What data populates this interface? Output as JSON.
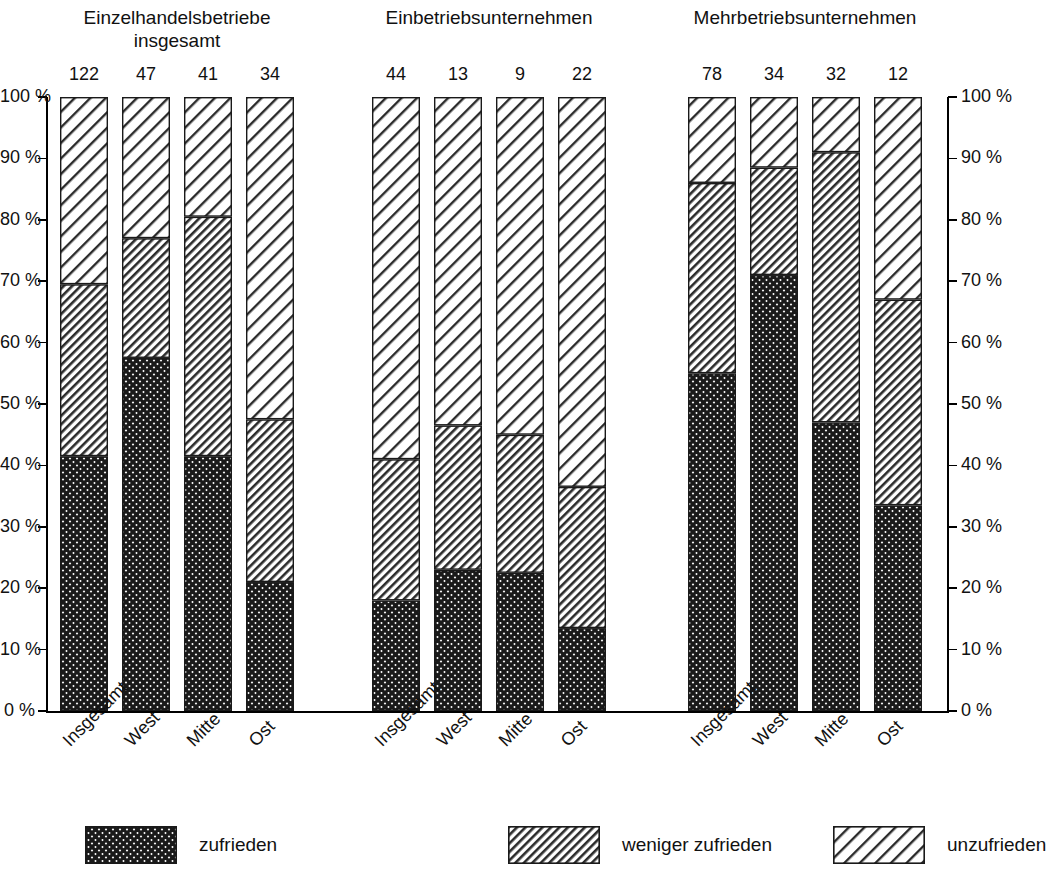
{
  "chart_data": {
    "type": "bar",
    "subtype": "stacked-percentage",
    "title": "",
    "xlabel": "",
    "ylabel": "",
    "ylim": [
      0,
      100
    ],
    "ytick_labels": [
      "0 %",
      "10 %",
      "20 %",
      "30 %",
      "40 %",
      "50 %",
      "60 %",
      "70 %",
      "80 %",
      "90 %",
      "100 %"
    ],
    "ytick_values": [
      0,
      10,
      20,
      30,
      40,
      50,
      60,
      70,
      80,
      90,
      100
    ],
    "grid": false,
    "dual_y_axis": true,
    "legend_position": "bottom",
    "categories": [
      "Insgesamt",
      "West",
      "Mitte",
      "Ost"
    ],
    "series": [
      {
        "name": "zufrieden",
        "pattern": "cross-hatch-dark"
      },
      {
        "name": "weniger zufrieden",
        "pattern": "dense-diagonal-hatch"
      },
      {
        "name": "unzufrieden",
        "pattern": "sparse-diagonal-hatch"
      }
    ],
    "groups": [
      {
        "title": "Einzelhandelsbetriebe\ninsgesamt",
        "bars": [
          {
            "category": "Insgesamt",
            "n": "122",
            "zufrieden": 41.5,
            "weniger_zufrieden": 28.0,
            "unzufrieden": 30.5
          },
          {
            "category": "West",
            "n": "47",
            "zufrieden": 57.5,
            "weniger_zufrieden": 19.5,
            "unzufrieden": 23.0
          },
          {
            "category": "Mitte",
            "n": "41",
            "zufrieden": 41.5,
            "weniger_zufrieden": 39.0,
            "unzufrieden": 19.5
          },
          {
            "category": "Ost",
            "n": "34",
            "zufrieden": 21.0,
            "weniger_zufrieden": 26.5,
            "unzufrieden": 52.5
          }
        ]
      },
      {
        "title": "Einbetriebsunternehmen",
        "bars": [
          {
            "category": "Insgesamt",
            "n": "44",
            "zufrieden": 18.0,
            "weniger_zufrieden": 23.0,
            "unzufrieden": 59.0
          },
          {
            "category": "West",
            "n": "13",
            "zufrieden": 23.0,
            "weniger_zufrieden": 23.5,
            "unzufrieden": 53.5
          },
          {
            "category": "Mitte",
            "n": "9",
            "zufrieden": 22.5,
            "weniger_zufrieden": 22.5,
            "unzufrieden": 55.0
          },
          {
            "category": "Ost",
            "n": "22",
            "zufrieden": 13.5,
            "weniger_zufrieden": 23.0,
            "unzufrieden": 63.5
          }
        ]
      },
      {
        "title": "Mehrbetriebsunternehmen",
        "bars": [
          {
            "category": "Insgesamt",
            "n": "78",
            "zufrieden": 55.0,
            "weniger_zufrieden": 31.0,
            "unzufrieden": 14.0
          },
          {
            "category": "West",
            "n": "34",
            "zufrieden": 71.0,
            "weniger_zufrieden": 17.5,
            "unzufrieden": 11.5
          },
          {
            "category": "Mitte",
            "n": "32",
            "zufrieden": 47.0,
            "weniger_zufrieden": 44.0,
            "unzufrieden": 9.0
          },
          {
            "category": "Ost",
            "n": "12",
            "zufrieden": 33.5,
            "weniger_zufrieden": 33.5,
            "unzufrieden": 33.0
          }
        ]
      }
    ],
    "legend": [
      {
        "label": "zufrieden"
      },
      {
        "label": "weniger zufrieden"
      },
      {
        "label": "unzufrieden"
      }
    ]
  }
}
